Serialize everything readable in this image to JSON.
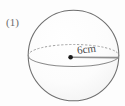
{
  "figure": {
    "item_number": "(1)",
    "shape_name": "sphere",
    "dimension_label": "6cm",
    "dimension_value": 6,
    "dimension_unit": "cm",
    "dimension_type": "radius",
    "colors": {
      "outline": "#6e6e6e",
      "fill": "#fbfbfb",
      "equator_solid": "#8a8a8a",
      "equator_dashed": "#9a9a9a",
      "radius_line": "#8e8e8e",
      "center_dot": "#1a1a1a",
      "label_text": "#6b6b6b",
      "dimension_text": "#4a4a4a",
      "background": "#fdfdfd"
    },
    "geometry": {
      "center_x": 73.5,
      "center_y": 55.5,
      "radius": 45.5,
      "equator_semi_minor": 11,
      "center_dot_x": 71,
      "center_dot_y": 57,
      "radius_line_end_x": 118,
      "radius_line_end_y": 58
    }
  }
}
